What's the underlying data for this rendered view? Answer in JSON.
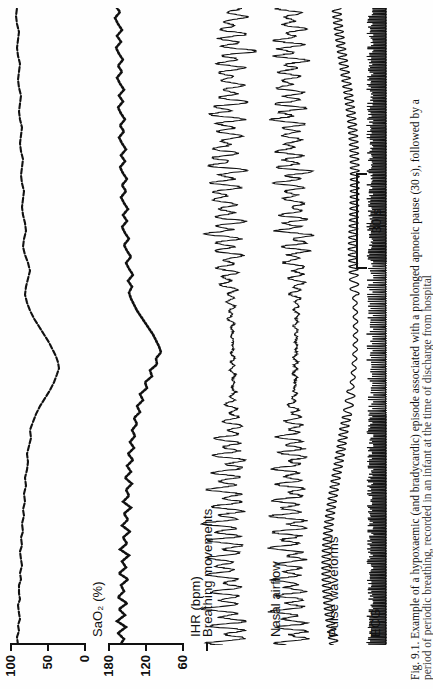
{
  "figure": {
    "caption_lines": [
      "Fig. 9.1. Example of a hypoxaemic (and bradycardic) episode associated with a prolonged apnoeic pause (30 s), followed by a",
      "period of periodic breathing, recorded in an infant at the time of discharge from hospital"
    ],
    "scalebar": {
      "label": "30 s"
    },
    "channels": [
      {
        "id": "sao2",
        "label": "SaO₂ (%)",
        "axis_ticks": [
          "100",
          "50",
          "0"
        ],
        "axis_values": [
          100,
          50,
          0
        ],
        "trace_style": "dotted-line"
      },
      {
        "id": "ihr",
        "label": "IHR (bpm)",
        "axis_ticks": [
          "180",
          "120",
          "60"
        ],
        "axis_values": [
          180,
          120,
          60
        ],
        "trace_style": "dotted-dense"
      },
      {
        "id": "breathing",
        "label": "Breathing movements",
        "axis_ticks": [],
        "axis_values": [],
        "trace_style": "oscillatory"
      },
      {
        "id": "nasal",
        "label": "Nasal airflow",
        "axis_ticks": [],
        "axis_values": [],
        "trace_style": "oscillatory"
      },
      {
        "id": "pulse",
        "label": "Pulse waveforms",
        "axis_ticks": [],
        "axis_values": [],
        "trace_style": "dense-pulse"
      },
      {
        "id": "ecg",
        "label": "ECG",
        "axis_ticks": [],
        "axis_values": [],
        "trace_style": "ecg-comb"
      }
    ]
  },
  "chart_data": {
    "type": "line",
    "title": "Fig. 9.1. Example of a hypoxaemic (and bradycardic) episode associated with a prolonged apnoeic pause (30 s), followed by a",
    "subtitle": "period of periodic breathing, recorded in an infant at the time of discharge from hospital",
    "xlabel": "Time",
    "ylabel": "",
    "grid": false,
    "legend_position": "none",
    "x_scalebar_seconds": 30,
    "panels": [
      {
        "name": "SaO2 (%)",
        "ylabel": "SaO₂ (%)",
        "ylim": [
          0,
          100
        ],
        "yticks": [
          0,
          50,
          100
        ],
        "ytick_labels": [
          "0",
          "50",
          "100"
        ],
        "description": "Oxygen saturation falls from ~95% plateau to a nadir of ~55% during the apnoeic pause then recovers with periodic oscillations",
        "values": [
          95,
          95,
          94,
          95,
          94,
          93,
          92,
          90,
          86,
          80,
          72,
          64,
          58,
          56,
          58,
          63,
          70,
          78,
          84,
          88,
          91,
          92,
          90,
          87,
          89,
          92,
          93,
          92,
          90,
          91,
          93,
          94,
          93,
          92,
          93,
          94,
          94,
          93,
          94,
          95
        ]
      },
      {
        "name": "IHR (bpm)",
        "ylabel": "IHR (bpm)",
        "ylim": [
          60,
          180
        ],
        "yticks": [
          60,
          120,
          180
        ],
        "ytick_labels": [
          "60",
          "120",
          "180"
        ],
        "description": "Instantaneous heart rate drops from ~150 bpm to a bradycardic nadir of ~75 bpm then recovers with scatter",
        "values": [
          150,
          152,
          148,
          150,
          146,
          144,
          140,
          134,
          126,
          116,
          104,
          92,
          82,
          76,
          78,
          86,
          96,
          108,
          120,
          130,
          138,
          142,
          140,
          136,
          139,
          144,
          148,
          146,
          143,
          145,
          149,
          151,
          149,
          147,
          148,
          150,
          151,
          149,
          150,
          152
        ]
      },
      {
        "name": "Breathing movements",
        "ylabel": "",
        "ylim": [
          -1,
          1
        ],
        "yticks": [],
        "ytick_labels": [],
        "description": "Regular respiratory excursions, then a 30 s apnoeic pause of flat/low amplitude, followed by periodic breathing with waxing and waning amplitude"
      },
      {
        "name": "Nasal airflow",
        "ylabel": "",
        "ylim": [
          -1,
          1
        ],
        "yticks": [],
        "ytick_labels": [],
        "description": "Airflow absent during the apnoeic pause, resuming with periodic breathing clusters"
      },
      {
        "name": "Pulse waveforms",
        "ylabel": "",
        "ylim": [
          -1,
          1
        ],
        "yticks": [],
        "ytick_labels": [],
        "description": "Pulse oximeter plethysmograph; amplitude and baseline shift through the bradycardic episode"
      },
      {
        "name": "ECG",
        "ylabel": "",
        "ylim": [
          -1,
          1
        ],
        "yticks": [],
        "ytick_labels": [],
        "description": "Continuous compressed ECG trace; R-R interval widens during bradycardia"
      }
    ]
  }
}
